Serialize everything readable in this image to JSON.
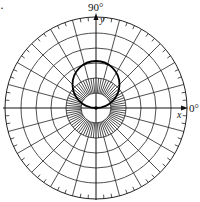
{
  "figure": {
    "marker": "·",
    "labels": {
      "top_angle": "90°",
      "right_angle": "0°",
      "x_axis": "x",
      "y_axis": "y"
    },
    "grid": {
      "rings": 6,
      "ring_spacing_px": 15,
      "spoke_step_deg": 15,
      "inner_spoke_step_deg": 5,
      "tick_step_deg": 5
    },
    "curve": {
      "type": "circle",
      "equation": "r = 2a sin θ",
      "center_polar": "(a, 90°)",
      "passes_through_pole": true
    },
    "colors": {
      "grid": "#222222",
      "curve": "#000000",
      "background": "#ffffff"
    }
  }
}
